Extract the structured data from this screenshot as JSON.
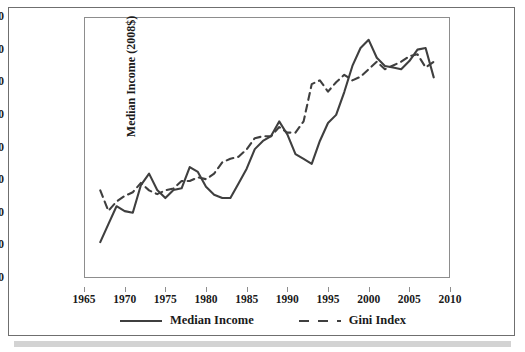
{
  "chart_data": {
    "type": "line",
    "title": "",
    "xlabel": "",
    "ylabel": "Median Income (2008$)",
    "y2label": "Gini Index",
    "xlim": [
      1965,
      2010
    ],
    "ylim": [
      38000,
      54000
    ],
    "y2lim": [
      0.35,
      0.49
    ],
    "xticks": [
      1965,
      1970,
      1975,
      1980,
      1985,
      1990,
      1995,
      2000,
      2005,
      2010
    ],
    "yticks": [
      38000,
      40000,
      42000,
      44000,
      46000,
      48000,
      50000,
      52000,
      54000
    ],
    "y2ticks": [
      0.35,
      0.37,
      0.39,
      0.41,
      0.43,
      0.45,
      0.47,
      0.49
    ],
    "grid": false,
    "legend_position": "bottom",
    "x": [
      1967,
      1968,
      1969,
      1970,
      1971,
      1972,
      1973,
      1974,
      1975,
      1976,
      1977,
      1978,
      1979,
      1980,
      1981,
      1982,
      1983,
      1984,
      1985,
      1986,
      1987,
      1988,
      1989,
      1990,
      1991,
      1992,
      1993,
      1994,
      1995,
      1996,
      1997,
      1998,
      1999,
      2000,
      2001,
      2002,
      2003,
      2004,
      2005,
      2006,
      2007,
      2008
    ],
    "series": [
      {
        "name": "Median Income",
        "axis": "left",
        "style": "solid",
        "color": "#3f3f3f",
        "values": [
          40200,
          41300,
          42400,
          42100,
          42000,
          43700,
          44400,
          43400,
          42900,
          43400,
          43500,
          44800,
          44500,
          43600,
          43100,
          42900,
          42900,
          43800,
          44700,
          45900,
          46400,
          46700,
          47600,
          46800,
          45600,
          45300,
          45000,
          46400,
          47500,
          48000,
          49400,
          51000,
          52100,
          52600,
          51500,
          51000,
          50900,
          50800,
          51300,
          52000,
          52100,
          50300
        ]
      },
      {
        "name": "Gini Index",
        "axis": "right",
        "style": "dashed",
        "color": "#3f3f3f",
        "values": [
          0.397,
          0.386,
          0.391,
          0.394,
          0.396,
          0.401,
          0.397,
          0.395,
          0.397,
          0.398,
          0.402,
          0.402,
          0.404,
          0.403,
          0.406,
          0.412,
          0.414,
          0.415,
          0.419,
          0.425,
          0.426,
          0.426,
          0.431,
          0.428,
          0.428,
          0.434,
          0.454,
          0.456,
          0.45,
          0.455,
          0.459,
          0.456,
          0.458,
          0.462,
          0.466,
          0.462,
          0.464,
          0.466,
          0.469,
          0.47,
          0.463,
          0.466
        ]
      }
    ]
  },
  "legend": {
    "items": [
      {
        "label": "Median Income",
        "style": "solid"
      },
      {
        "label": "Gini Index",
        "style": "dashed"
      }
    ]
  }
}
